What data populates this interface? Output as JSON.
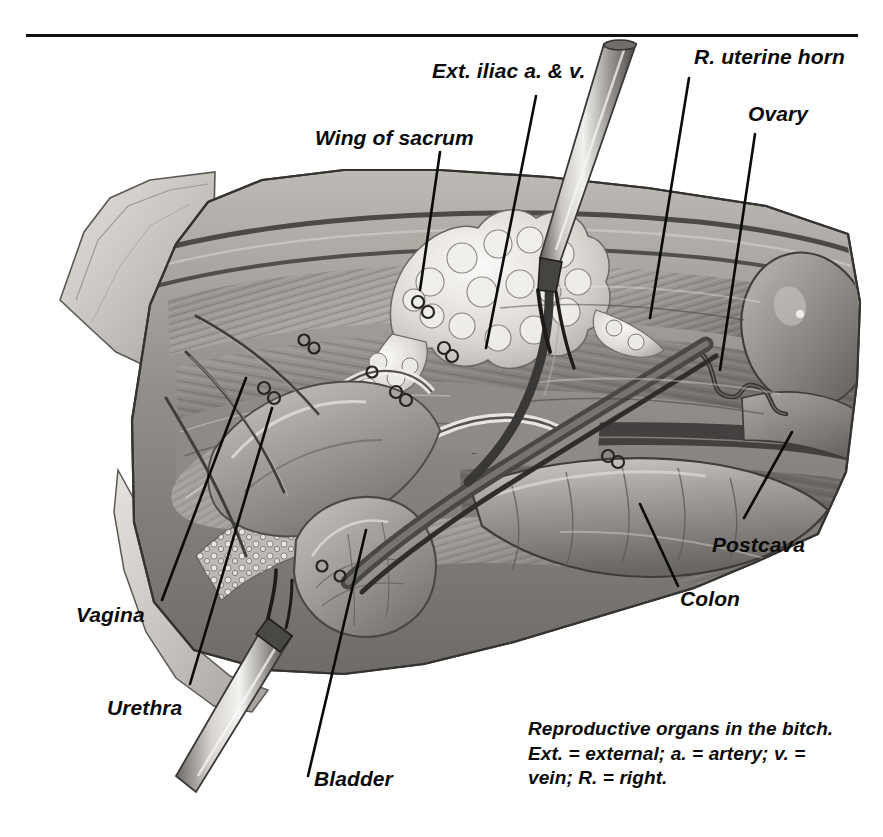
{
  "figure": {
    "title_rule": "horizontal-rule",
    "subject": "Reproductive organs in the bitch",
    "medium": "grayscale surgical illustration",
    "labels": [
      {
        "id": "ext-iliac",
        "text": "Ext. iliac a. & v.",
        "x": 432,
        "y": 60,
        "size": 21
      },
      {
        "id": "r-uterine-horn",
        "text": "R. uterine horn",
        "x": 694,
        "y": 46,
        "size": 21
      },
      {
        "id": "ovary",
        "text": "Ovary",
        "x": 748,
        "y": 103,
        "size": 21
      },
      {
        "id": "wing-of-sacrum",
        "text": "Wing of sacrum",
        "x": 315,
        "y": 127,
        "size": 21
      },
      {
        "id": "postcava",
        "text": "Postcava",
        "x": 712,
        "y": 534,
        "size": 21
      },
      {
        "id": "colon",
        "text": "Colon",
        "x": 680,
        "y": 588,
        "size": 21
      },
      {
        "id": "vagina",
        "text": "Vagina",
        "x": 76,
        "y": 604,
        "size": 21
      },
      {
        "id": "urethra",
        "text": "Urethra",
        "x": 107,
        "y": 697,
        "size": 21
      },
      {
        "id": "bladder",
        "text": "Bladder",
        "x": 314,
        "y": 768,
        "size": 21
      }
    ],
    "caption_lines": [
      "Reproductive organs in the bitch.",
      "Ext. = external; a. = artery; v. =",
      "vein; R. = right."
    ],
    "caption": {
      "x": 528,
      "y": 717,
      "size": 19
    },
    "colors": {
      "ink": "#0b0b0b",
      "paper": "#ffffff",
      "tissue_light": "#cfcbc6",
      "tissue_mid": "#9d9a96",
      "tissue_dark": "#6d6a67",
      "tissue_deep": "#4a4846",
      "fat_highlight": "#efeeec",
      "vessel": "#56534f"
    }
  }
}
